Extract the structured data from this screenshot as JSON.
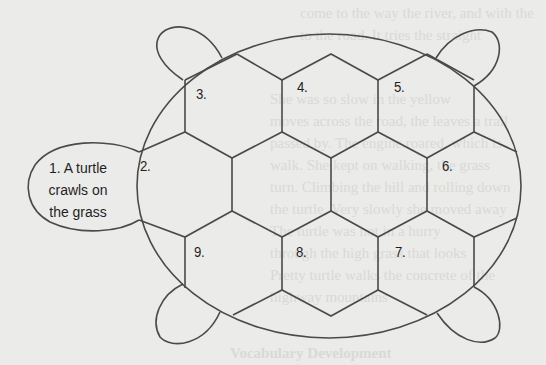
{
  "diagram": {
    "type": "turtle-shell sequence organizer",
    "head": {
      "lines": [
        "1. A turtle",
        "crawls on",
        "the grass"
      ]
    },
    "segments": [
      {
        "id": "2",
        "label": "2."
      },
      {
        "id": "3",
        "label": "3."
      },
      {
        "id": "4",
        "label": "4."
      },
      {
        "id": "5",
        "label": "5."
      },
      {
        "id": "6",
        "label": "6."
      },
      {
        "id": "7",
        "label": "7."
      },
      {
        "id": "8",
        "label": "8."
      },
      {
        "id": "9",
        "label": "9."
      }
    ],
    "colors": {
      "background": "#ebebe9",
      "line": "#4a4a4a",
      "text": "#1f1f1f"
    }
  },
  "bleed_through": {
    "lines": [
      "come to the way the river, and with the",
      "to the road. It tries the straight",
      "She was so slow in the yellow",
      "moves across the road, the leaves a trail",
      "passed by. The engine roared, which is",
      "walk. She kept on walking, the grass",
      "turn. Climbing the hill and rolling down",
      "the turtle. Very slowly she moved away",
      "The turtle was not in a hurry",
      "through the high grass that looks",
      "Pretty turtle walks the concrete of the",
      "highway mountains",
      "Vocabulary Development"
    ]
  }
}
